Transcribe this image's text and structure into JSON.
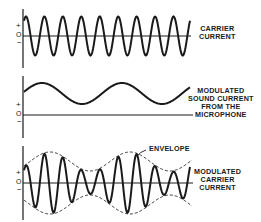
{
  "diagram": {
    "colors": {
      "ink": "#1a1a1a",
      "background": "#ffffff"
    },
    "axis_signs": {
      "plus": "+",
      "zero": "O",
      "minus": "−"
    },
    "panels": [
      {
        "id": "carrier",
        "label_lines": [
          "CARRIER",
          "CURRENT"
        ],
        "waveform": "sine",
        "cycles": 9,
        "style": "solid"
      },
      {
        "id": "sound",
        "label_lines": [
          "MODULATED",
          "SOUND CURRENT",
          "FROM THE",
          "MICROPHONE"
        ],
        "waveform": "low-frequency sine, offset positive",
        "cycles": 2,
        "style": "solid"
      },
      {
        "id": "modulated",
        "label_lines": [
          "MODULATED",
          "CARRIER",
          "CURRENT"
        ],
        "waveform": "amplitude-modulated sine",
        "cycles": 9,
        "style": "solid",
        "envelope": {
          "label": "ENVELOPE",
          "style": "dashed"
        }
      }
    ]
  }
}
